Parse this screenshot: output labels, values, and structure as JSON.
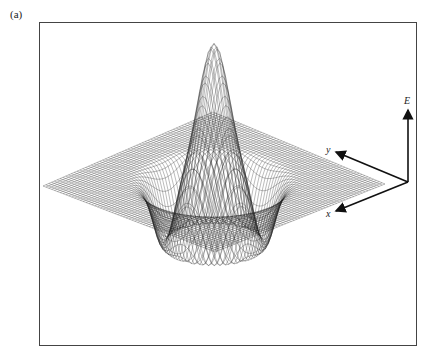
{
  "figure": {
    "panel_label": "(a)",
    "axes": {
      "vertical_label": "E",
      "y_label": "y",
      "x_label": "x"
    },
    "colors": {
      "mesh": "#1a1a1a",
      "frame": "#444444",
      "background": "#ffffff"
    }
  },
  "chart_data": {
    "type": "surface-wireframe",
    "title": "",
    "panel": "(a)",
    "axis_labels": {
      "x": "x",
      "y": "y",
      "z": "E"
    },
    "surface": {
      "shape": "radially symmetric: narrow central peak, surrounding ring trough, flat outer plane",
      "peak_height_relative": 1.0,
      "trough_depth_relative": -0.35,
      "grid_resolution": 60
    }
  }
}
